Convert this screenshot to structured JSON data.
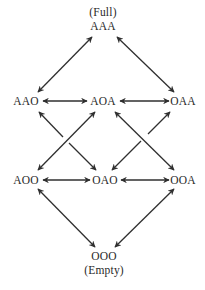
{
  "diagram": {
    "type": "lattice",
    "top_caption": "(Full)",
    "bottom_caption": "(Empty)",
    "nodes": {
      "AAA": "AAA",
      "AAO": "AAO",
      "AOA": "AOA",
      "OAA": "OAA",
      "AOO": "AOO",
      "OAO": "OAO",
      "OOA": "OOA",
      "OOO": "OOO"
    },
    "edges": [
      {
        "from": "AAA",
        "to": "AAO",
        "bidirectional": true
      },
      {
        "from": "AAA",
        "to": "OAA",
        "bidirectional": true
      },
      {
        "from": "AAO",
        "to": "AOA",
        "bidirectional": true
      },
      {
        "from": "AOA",
        "to": "OAA",
        "bidirectional": true
      },
      {
        "from": "AAO",
        "to": "OAO",
        "bidirectional": true
      },
      {
        "from": "AOA",
        "to": "AOO",
        "bidirectional": true
      },
      {
        "from": "AOA",
        "to": "OOA",
        "bidirectional": true
      },
      {
        "from": "OAA",
        "to": "OAO",
        "bidirectional": true
      },
      {
        "from": "AOO",
        "to": "OAO",
        "bidirectional": true
      },
      {
        "from": "OAO",
        "to": "OOA",
        "bidirectional": true
      },
      {
        "from": "AOO",
        "to": "OOO",
        "bidirectional": true
      },
      {
        "from": "OOA",
        "to": "OOO",
        "bidirectional": true
      }
    ],
    "line_color": "#2f2f2f"
  }
}
